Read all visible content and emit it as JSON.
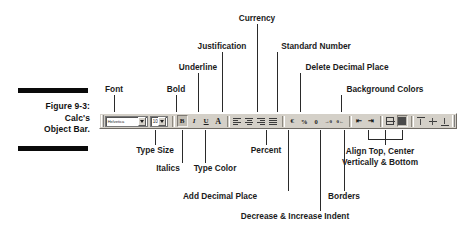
{
  "figure": {
    "caption_lines": [
      "Figure 9-3:",
      "Calc's",
      "Object Bar."
    ],
    "rule_color": "#0a0a0a"
  },
  "toolbar": {
    "name": "Calc's Object Bar",
    "background": "#d4d0c8",
    "font_name_value": "Helvetica",
    "font_name_placeholder": "Font Name",
    "font_size_value": "10",
    "font_size_placeholder": "Size",
    "buttons": [
      {
        "name": "bold-button",
        "label": "Bold",
        "glyph": "B"
      },
      {
        "name": "italic-button",
        "label": "Italics",
        "glyph": "I"
      },
      {
        "name": "underline-button",
        "label": "Underline",
        "glyph": "U"
      },
      {
        "name": "font-color-button",
        "label": "Type Color",
        "glyph": "A"
      },
      {
        "name": "align-left-button",
        "label": "Align Left",
        "glyph": "≡"
      },
      {
        "name": "align-center-button",
        "label": "Align Center",
        "glyph": "≡"
      },
      {
        "name": "align-right-button",
        "label": "Align Right",
        "glyph": "≡"
      },
      {
        "name": "align-justified-button",
        "label": "Justified",
        "glyph": "≡"
      },
      {
        "name": "currency-format-button",
        "label": "Currency",
        "glyph": "€"
      },
      {
        "name": "percent-format-button",
        "label": "Percent",
        "glyph": "%"
      },
      {
        "name": "standard-number-button",
        "label": "Standard Number",
        "glyph": "0"
      },
      {
        "name": "add-decimal-place-button",
        "label": "Add Decimal Place",
        "glyph": ".0"
      },
      {
        "name": "delete-decimal-place-button",
        "label": "Delete Decimal Place",
        "glyph": ".0"
      },
      {
        "name": "decrease-indent-button",
        "label": "Decrease Indent",
        "glyph": "⇤"
      },
      {
        "name": "increase-indent-button",
        "label": "Increase Indent",
        "glyph": "⇥"
      },
      {
        "name": "borders-button",
        "label": "Borders",
        "glyph": "▦"
      },
      {
        "name": "background-color-button",
        "label": "Background Colors",
        "glyph": "■"
      },
      {
        "name": "align-top-button",
        "label": "Align Top",
        "glyph": "⤒"
      },
      {
        "name": "align-center-vertically-button",
        "label": "Align Center Vertically",
        "glyph": "↕"
      },
      {
        "name": "align-bottom-button",
        "label": "Align Bottom",
        "glyph": "⤓"
      }
    ]
  },
  "annotations": [
    {
      "id": "currency",
      "text": "Currency",
      "text2": ""
    },
    {
      "id": "justification",
      "text": "Justification",
      "text2": ""
    },
    {
      "id": "standard-number",
      "text": "Standard Number",
      "text2": ""
    },
    {
      "id": "underline",
      "text": "Underline",
      "text2": ""
    },
    {
      "id": "delete-decimal",
      "text": "Delete Decimal Place",
      "text2": ""
    },
    {
      "id": "bold",
      "text": "Bold",
      "text2": ""
    },
    {
      "id": "background",
      "text": "Background Colors",
      "text2": ""
    },
    {
      "id": "font",
      "text": "Font",
      "text2": ""
    },
    {
      "id": "type-size",
      "text": "Type Size",
      "text2": ""
    },
    {
      "id": "percent",
      "text": "Percent",
      "text2": ""
    },
    {
      "id": "italics",
      "text": "Italics",
      "text2": ""
    },
    {
      "id": "type-color",
      "text": "Type Color",
      "text2": ""
    },
    {
      "id": "align-vert",
      "text": "Align Top, Center",
      "text2": "Vertically & Bottom"
    },
    {
      "id": "add-decimal",
      "text": "Add Decimal Place",
      "text2": ""
    },
    {
      "id": "borders",
      "text": "Borders",
      "text2": ""
    },
    {
      "id": "indent",
      "text": "Decrease & Increase Indent",
      "text2": ""
    }
  ]
}
